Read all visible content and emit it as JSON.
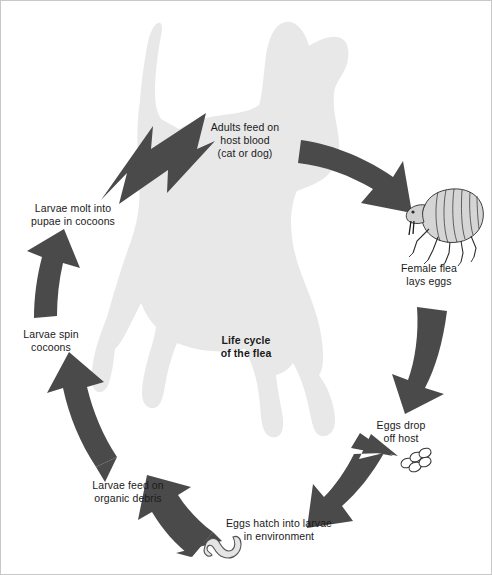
{
  "diagram": {
    "title": "Life cycle\nof the flea",
    "colors": {
      "arrow": "#4a4a4a",
      "silhouette": "#e6e6e6",
      "background": "#ffffff",
      "text": "#1a1a1a",
      "egg_fill": "#ffffff",
      "egg_stroke": "#333333",
      "flea_fill": "#d8d8d8",
      "flea_stroke": "#2b2b2b",
      "larva_fill": "#e8e8e8",
      "larva_stroke": "#555555"
    },
    "stages": [
      {
        "id": "adults-feed",
        "label": "Adults feed on\nhost blood\n(cat or dog)",
        "order": 1
      },
      {
        "id": "female-lays-eggs",
        "label": "Female flea\nlays eggs",
        "order": 2
      },
      {
        "id": "eggs-drop",
        "label": "Eggs drop\noff host",
        "order": 3
      },
      {
        "id": "eggs-hatch",
        "label": "Eggs hatch into larvae\nin environment",
        "order": 4
      },
      {
        "id": "larvae-feed",
        "label": "Larvae feed on\norganic debris",
        "order": 5
      },
      {
        "id": "larvae-spin",
        "label": "Larvae spin\ncocoons",
        "order": 6
      },
      {
        "id": "larvae-molt",
        "label": "Larvae molt into\npupae in cocoons",
        "order": 7
      }
    ],
    "illustrations": [
      {
        "id": "dog-silhouette",
        "name": "dog-silhouette"
      },
      {
        "id": "adult-flea",
        "name": "adult-flea-illustration"
      },
      {
        "id": "flea-eggs",
        "name": "flea-eggs-illustration",
        "count": 5
      },
      {
        "id": "flea-larva",
        "name": "flea-larva-illustration"
      }
    ],
    "arrows": [
      {
        "id": "arrow-to-adults",
        "from": "larvae-molt",
        "to": "adults-feed"
      },
      {
        "id": "arrow-to-female",
        "from": "adults-feed",
        "to": "female-lays-eggs"
      },
      {
        "id": "arrow-to-drop",
        "from": "female-lays-eggs",
        "to": "eggs-drop"
      },
      {
        "id": "arrow-to-hatch",
        "from": "eggs-drop",
        "to": "eggs-hatch"
      },
      {
        "id": "arrow-to-feed",
        "from": "eggs-hatch",
        "to": "larvae-feed"
      },
      {
        "id": "arrow-to-spin",
        "from": "larvae-feed",
        "to": "larvae-spin"
      },
      {
        "id": "arrow-to-molt",
        "from": "larvae-spin",
        "to": "larvae-molt"
      }
    ]
  }
}
